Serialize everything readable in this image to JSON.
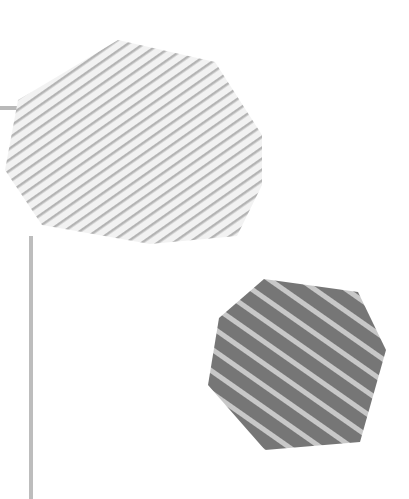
{
  "canvas": {
    "width": 409,
    "height": 499,
    "background": "#ffffff"
  },
  "shapes": [
    {
      "name": "light-striped-octagon",
      "fill_base": "#f2f2f2",
      "stripe_color": "#b4b4b4",
      "points": "118,40 215,62 262,135 262,185 237,236 150,244 42,225 5,170 18,100 60,75"
    },
    {
      "name": "dark-striped-heptagon",
      "fill_base": "#767676",
      "stripe_color": "#c8c8c8",
      "points": "264,279 358,292 386,350 360,442 265,450 208,385 219,318"
    }
  ],
  "lines": [
    {
      "name": "horizontal-gray-line",
      "color": "#b9b9b9"
    },
    {
      "name": "vertical-gray-line",
      "color": "#bdbdbd"
    }
  ]
}
